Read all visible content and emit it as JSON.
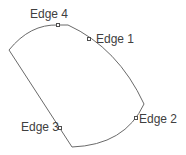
{
  "diagram": {
    "type": "closed-shape-with-edges",
    "stroke_color": "#6a6a6a",
    "label_color": "#404040",
    "edges": [
      {
        "label": "Edge 1"
      },
      {
        "label": "Edge 2"
      },
      {
        "label": "Edge 3"
      },
      {
        "label": "Edge 4"
      }
    ]
  }
}
